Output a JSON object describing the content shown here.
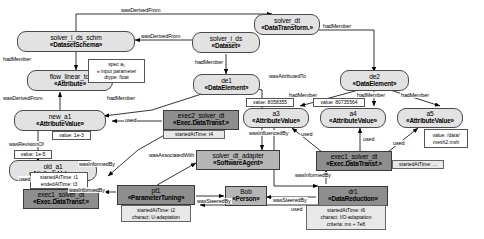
{
  "diagram": {
    "colors": {
      "entity_fill": "#e2e2e2",
      "activity_fill": "#8e8e8e",
      "agent_fill": "#b5b5b5",
      "note_fill": "#ffffff",
      "line": "#000000"
    }
  },
  "nodes": [
    {
      "id": "solver_dt",
      "name": "solver_dt",
      "stereotype": "«DataTransform.»",
      "kind": "entity"
    },
    {
      "id": "solver_i_ds_schm",
      "name": "solver_i_ds_schm",
      "stereotype": "«DatasetSchema»",
      "kind": "entity"
    },
    {
      "id": "solver_i_ds",
      "name": "solver_i_ds",
      "stereotype": "«Dataset»",
      "kind": "entity"
    },
    {
      "id": "flow_linear_tol",
      "name": "flow_linear_tol",
      "stereotype": "«Attribute»",
      "kind": "entity"
    },
    {
      "id": "de1",
      "name": "de1",
      "stereotype": "«DataElement»",
      "kind": "entity"
    },
    {
      "id": "de2",
      "name": "de2",
      "stereotype": "«DataElement»",
      "kind": "entity"
    },
    {
      "id": "new_a1",
      "name": "new_a1",
      "stereotype": "«AttributeValue»",
      "kind": "entity"
    },
    {
      "id": "old_a1",
      "name": "old_a1",
      "stereotype": "«AttributeValue»",
      "kind": "entity"
    },
    {
      "id": "a3",
      "name": "a3",
      "stereotype": "«AttributeValue»",
      "kind": "entity"
    },
    {
      "id": "a4",
      "name": "a4",
      "stereotype": "«AttributeValue»",
      "kind": "entity"
    },
    {
      "id": "a5",
      "name": "a5",
      "stereotype": "«AttributeValue»",
      "kind": "entity"
    },
    {
      "id": "exec2_solver_dt",
      "name": "exec2_solver_dt",
      "stereotype": "«Exec.DataTransf.»",
      "kind": "activity"
    },
    {
      "id": "exec1_solver_dt_l",
      "name": "exec1_solver_dt",
      "stereotype": "«Exec.DataTransf.»",
      "kind": "activity"
    },
    {
      "id": "exec1_solver_dt_r",
      "name": "exec1_solver_dt",
      "stereotype": "«Exec.DataTransf.»",
      "kind": "activity"
    },
    {
      "id": "pt1",
      "name": "pt1",
      "stereotype": "«ParameterTuning»",
      "kind": "activity"
    },
    {
      "id": "dr1",
      "name": "dr1",
      "stereotype": "«DataReduction»",
      "kind": "activity"
    },
    {
      "id": "solver_dt_adapter",
      "name": "solver_dt_adapter",
      "stereotype": "«SoftwareAgent»",
      "kind": "agent"
    },
    {
      "id": "bob",
      "name": "Bob",
      "stereotype": "«Person»",
      "kind": "agent"
    }
  ],
  "notes": [
    {
      "id": "note_spec_a1",
      "lines": [
        "spec a₁",
        "« input parameter",
        "dtype: float"
      ]
    },
    {
      "id": "note_new_a1",
      "lines": [
        "value: 1e-3"
      ]
    },
    {
      "id": "note_old_a1",
      "lines": [
        "value: 1e-5"
      ]
    },
    {
      "id": "note_a3",
      "lines": [
        "value: 8058355"
      ]
    },
    {
      "id": "note_a4",
      "lines": [
        "value: 80735564"
      ]
    },
    {
      "id": "note_a5",
      "lines": [
        "value: /data/",
        "mesh2.msh"
      ]
    },
    {
      "id": "note_exec2",
      "lines": [
        "startedAtTime: t4"
      ]
    },
    {
      "id": "note_exec1_l",
      "lines": [
        "startedAtTime: t1",
        "endedAtTime: t3"
      ]
    },
    {
      "id": "note_exec1_r",
      "lines": [
        "startedAtTime: ..."
      ]
    },
    {
      "id": "note_pt1",
      "lines": [
        "startedAtTime: t2",
        "charact: U-adaptation"
      ]
    },
    {
      "id": "note_dr1",
      "lines": [
        "startedAtTime: t6",
        "charact: I/O-adaptation",
        "criteria: mx ÷ 7e8"
      ]
    }
  ],
  "edges": [
    {
      "id": "e1",
      "label": "wasDerivedFrom",
      "from": "solver_i_ds_schm",
      "to": "solver_dt"
    },
    {
      "id": "e2",
      "label": "wasDerivedFrom",
      "from": "solver_i_ds",
      "to": "solver_i_ds_schm"
    },
    {
      "id": "e3",
      "label": "hadMember",
      "from": "solver_i_ds_schm",
      "to": "flow_linear_tol"
    },
    {
      "id": "e4",
      "label": "hadMember",
      "from": "solver_i_ds",
      "to": "de1"
    },
    {
      "id": "e5",
      "label": "hadMember",
      "from": "solver_dt",
      "to": "de2"
    },
    {
      "id": "e6",
      "label": "wasAttributedTo",
      "from": "de1",
      "to": "solver_dt_adapter"
    },
    {
      "id": "e7",
      "label": "wasDerivedFrom",
      "from": "new_a1",
      "to": "flow_linear_tol"
    },
    {
      "id": "e8",
      "label": "hadMember",
      "from": "de1",
      "to": "new_a1"
    },
    {
      "id": "e9",
      "label": "used",
      "from": "exec2_solver_dt",
      "to": "new_a1"
    },
    {
      "id": "e10",
      "label": "wasRevisionOf",
      "from": "new_a1",
      "to": "old_a1"
    },
    {
      "id": "e11",
      "label": "used",
      "from": "exec1_solver_dt_l",
      "to": "old_a1"
    },
    {
      "id": "e12",
      "label": "wasInformedBy",
      "from": "exec2_solver_dt",
      "to": "exec1_solver_dt_l"
    },
    {
      "id": "e13",
      "label": "wasInformedBy",
      "from": "pt1",
      "to": "exec1_solver_dt_l"
    },
    {
      "id": "e14",
      "label": "wasAssociatedWith",
      "from": "pt1",
      "to": "solver_dt_adapter"
    },
    {
      "id": "e15",
      "label": "wasSteeredBy",
      "from": "pt1",
      "to": "bob"
    },
    {
      "id": "e16",
      "label": "wasSteeredBy",
      "from": "dr1",
      "to": "bob"
    },
    {
      "id": "e17",
      "label": "hadMember",
      "from": "de2",
      "to": "a3"
    },
    {
      "id": "e18",
      "label": "hadMember",
      "from": "de2",
      "to": "a4"
    },
    {
      "id": "e19",
      "label": "hadMember",
      "from": "de2",
      "to": "a5"
    },
    {
      "id": "e20",
      "label": "wasInfluencedBy",
      "from": "a3",
      "to": "dr1"
    },
    {
      "id": "e21",
      "label": "used",
      "from": "exec1_solver_dt_r",
      "to": "a3"
    },
    {
      "id": "e22",
      "label": "used",
      "from": "exec1_solver_dt_r",
      "to": "a4"
    },
    {
      "id": "e23",
      "label": "used",
      "from": "exec1_solver_dt_r",
      "to": "a5"
    },
    {
      "id": "e24",
      "label": "wasInformedBy",
      "from": "dr1",
      "to": "exec1_solver_dt_r"
    },
    {
      "id": "e25",
      "label": "used",
      "from": "dr1",
      "to": "pt1"
    }
  ]
}
